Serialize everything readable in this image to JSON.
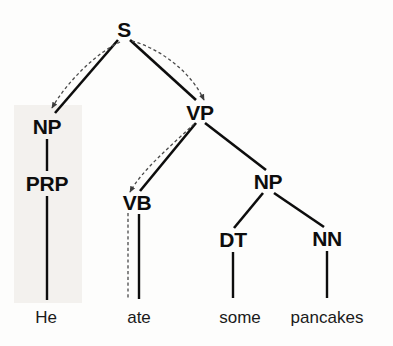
{
  "figure": {
    "name": "constituency-parse-tree",
    "sentence": "He ate some pancakes",
    "background_color": "#fdfdfc",
    "ink_color": "#0d0d0d",
    "shade_color": "#ebe7e2"
  },
  "nodes": [
    {
      "id": "s",
      "label": "S",
      "x": 124,
      "y": 30,
      "level": 0
    },
    {
      "id": "np1",
      "label": "NP",
      "x": 47,
      "y": 127,
      "level": 1
    },
    {
      "id": "vp",
      "label": "VP",
      "x": 200,
      "y": 113,
      "level": 1
    },
    {
      "id": "prp",
      "label": "PRP",
      "x": 47,
      "y": 184,
      "level": 2
    },
    {
      "id": "vb",
      "label": "VB",
      "x": 137,
      "y": 203,
      "level": 2
    },
    {
      "id": "np2",
      "label": "NP",
      "x": 268,
      "y": 182,
      "level": 2
    },
    {
      "id": "dt",
      "label": "DT",
      "x": 233,
      "y": 240,
      "level": 3
    },
    {
      "id": "nn",
      "label": "NN",
      "x": 327,
      "y": 239,
      "level": 3
    }
  ],
  "leaves": [
    {
      "id": "w-he",
      "word": "He",
      "x": 46,
      "y": 318,
      "parent": "prp"
    },
    {
      "id": "w-ate",
      "word": "ate",
      "x": 139,
      "y": 318,
      "parent": "vb"
    },
    {
      "id": "w-some",
      "word": "some",
      "x": 240,
      "y": 318,
      "parent": "dt"
    },
    {
      "id": "w-pancakes",
      "word": "pancakes",
      "x": 327,
      "y": 318,
      "parent": "nn"
    }
  ],
  "solid_edges": [
    {
      "id": "edge-s-np1",
      "from": "S",
      "to": "NP",
      "x1": 118,
      "y1": 40,
      "x2": 55,
      "y2": 113
    },
    {
      "id": "edge-s-vp",
      "from": "S",
      "to": "VP",
      "x1": 130,
      "y1": 40,
      "x2": 196,
      "y2": 100
    },
    {
      "id": "edge-np1-prp",
      "from": "NP",
      "to": "PRP",
      "x1": 47,
      "y1": 139,
      "x2": 47,
      "y2": 171
    },
    {
      "id": "edge-vp-vb",
      "from": "VP",
      "to": "VB",
      "x1": 196,
      "y1": 123,
      "x2": 140,
      "y2": 191
    },
    {
      "id": "edge-vp-np2",
      "from": "VP",
      "to": "NP",
      "x1": 205,
      "y1": 123,
      "x2": 266,
      "y2": 170
    },
    {
      "id": "edge-np2-dt",
      "from": "NP",
      "to": "DT",
      "x1": 263,
      "y1": 193,
      "x2": 234,
      "y2": 228
    },
    {
      "id": "edge-np2-nn",
      "from": "NP",
      "to": "NN",
      "x1": 274,
      "y1": 193,
      "x2": 324,
      "y2": 227
    },
    {
      "id": "edge-prp-he",
      "from": "PRP",
      "to": "He",
      "x1": 47,
      "y1": 196,
      "x2": 47,
      "y2": 300
    },
    {
      "id": "edge-vb-ate",
      "from": "VB",
      "to": "ate",
      "x1": 139,
      "y1": 214,
      "x2": 139,
      "y2": 299
    },
    {
      "id": "edge-dt-some",
      "from": "DT",
      "to": "some",
      "x1": 233,
      "y1": 252,
      "x2": 233,
      "y2": 298
    },
    {
      "id": "edge-nn-pan",
      "from": "NN",
      "to": "pancakes",
      "x1": 327,
      "y1": 251,
      "x2": 327,
      "y2": 298
    }
  ],
  "dashed_arrows": [
    {
      "id": "head-arrow-s-np",
      "from": "S",
      "to": "NP",
      "path": "M 120 42 C 98 52, 68 80, 52 108",
      "arrowhead": true
    },
    {
      "id": "head-arrow-s-vp",
      "from": "S",
      "to": "VP",
      "path": "M 132 41 C 158 48, 190 70, 204 100",
      "arrowhead": true
    },
    {
      "id": "head-arrow-vp-vb",
      "from": "VP",
      "to": "VB",
      "path": "M 194 124 C 172 145, 142 170, 130 192",
      "arrowhead": true
    },
    {
      "id": "head-line-vb-ate",
      "from": "VB",
      "to": "ate",
      "path": "M 128 213 L 128 298",
      "arrowhead": false
    }
  ],
  "shaded_region": {
    "id": "np-subtree-highlight",
    "x": 14,
    "y": 105,
    "width": 68,
    "height": 198
  }
}
